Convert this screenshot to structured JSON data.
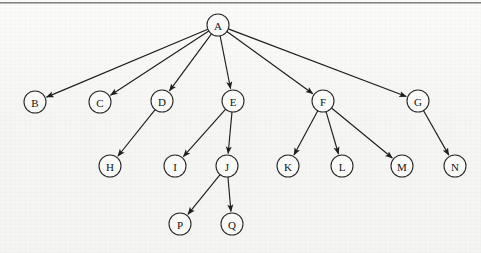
{
  "figure": {
    "kind": "tree-diagram",
    "background_color": "#f7f7f6",
    "node_fill_color": "#fbfbfa",
    "node_stroke_color": "#2a2a2a",
    "edge_color": "#1e1e1e",
    "top_rule_color": "#6f6f6f",
    "node_radius": 11,
    "canvas": {
      "width": 481,
      "height": 253
    }
  },
  "chart_data": {
    "type": "diagram",
    "title": "",
    "layout": "top-down rooted tree with directed parent-to-child arrows",
    "root": "A",
    "nodes": [
      {
        "id": "A",
        "label": "A",
        "x": 218,
        "y": 25,
        "depth": 0
      },
      {
        "id": "B",
        "label": "B",
        "x": 35,
        "y": 102,
        "depth": 1
      },
      {
        "id": "C",
        "label": "C",
        "x": 100,
        "y": 102,
        "depth": 1
      },
      {
        "id": "D",
        "label": "D",
        "x": 162,
        "y": 101,
        "depth": 1
      },
      {
        "id": "E",
        "label": "E",
        "x": 233,
        "y": 101,
        "depth": 1
      },
      {
        "id": "F",
        "label": "F",
        "x": 323,
        "y": 101,
        "depth": 1
      },
      {
        "id": "G",
        "label": "G",
        "x": 418,
        "y": 101,
        "depth": 1
      },
      {
        "id": "H",
        "label": "H",
        "x": 110,
        "y": 166,
        "depth": 2
      },
      {
        "id": "I",
        "label": "I",
        "x": 175,
        "y": 166,
        "depth": 2
      },
      {
        "id": "J",
        "label": "J",
        "x": 227,
        "y": 166,
        "depth": 2
      },
      {
        "id": "K",
        "label": "K",
        "x": 288,
        "y": 166,
        "depth": 2
      },
      {
        "id": "L",
        "label": "L",
        "x": 342,
        "y": 166,
        "depth": 2
      },
      {
        "id": "M",
        "label": "M",
        "x": 402,
        "y": 166,
        "depth": 2
      },
      {
        "id": "N",
        "label": "N",
        "x": 455,
        "y": 166,
        "depth": 2
      },
      {
        "id": "P",
        "label": "P",
        "x": 180,
        "y": 224,
        "depth": 3
      },
      {
        "id": "Q",
        "label": "Q",
        "x": 232,
        "y": 224,
        "depth": 3
      }
    ],
    "edges": [
      {
        "from": "A",
        "to": "B",
        "directed": true
      },
      {
        "from": "A",
        "to": "C",
        "directed": true
      },
      {
        "from": "A",
        "to": "D",
        "directed": true
      },
      {
        "from": "A",
        "to": "E",
        "directed": true
      },
      {
        "from": "A",
        "to": "F",
        "directed": true
      },
      {
        "from": "A",
        "to": "G",
        "directed": true
      },
      {
        "from": "D",
        "to": "H",
        "directed": true
      },
      {
        "from": "E",
        "to": "I",
        "directed": true
      },
      {
        "from": "E",
        "to": "J",
        "directed": true
      },
      {
        "from": "F",
        "to": "K",
        "directed": true
      },
      {
        "from": "F",
        "to": "L",
        "directed": true
      },
      {
        "from": "F",
        "to": "M",
        "directed": true
      },
      {
        "from": "G",
        "to": "N",
        "directed": true
      },
      {
        "from": "J",
        "to": "P",
        "directed": true
      },
      {
        "from": "J",
        "to": "Q",
        "directed": true
      }
    ],
    "node_count": 16,
    "edge_count": 15,
    "xlabel": "",
    "ylabel": "",
    "legend": []
  }
}
